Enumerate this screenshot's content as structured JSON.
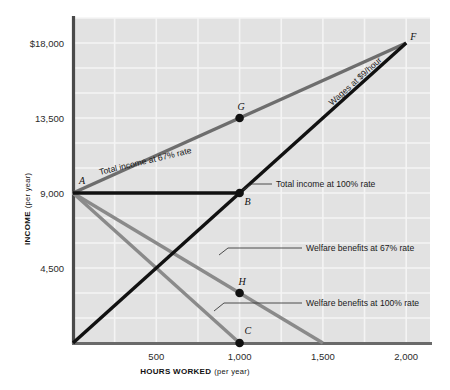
{
  "chart_data": {
    "type": "line",
    "title": "",
    "xlabel": "HOURS WORKED",
    "xlabel_sub": "(per year)",
    "ylabel": "INCOME",
    "ylabel_sub": "(per year)",
    "xlim": [
      0,
      2143
    ],
    "ylim": [
      0,
      19500
    ],
    "grid": true,
    "legend": "inline-annotations",
    "xticks": [
      {
        "value": 500,
        "label": "500"
      },
      {
        "value": 1000,
        "label": "1,000"
      },
      {
        "value": 1500,
        "label": "1,500"
      },
      {
        "value": 2000,
        "label": "2,000"
      }
    ],
    "yticks": [
      {
        "value": 4500,
        "label": "4,500"
      },
      {
        "value": 9000,
        "label": "9,000"
      },
      {
        "value": 13500,
        "label": "13,500"
      },
      {
        "value": 18000,
        "label": "$18,000"
      }
    ],
    "series": [
      {
        "name": "Wages at $9/hour",
        "label": "Wages at $9/hour",
        "color": "#111111",
        "width": 3.4,
        "points": [
          [
            0,
            0
          ],
          [
            2000,
            18000
          ]
        ]
      },
      {
        "name": "Total income at 67% rate",
        "label": "Total income at 67% rate",
        "color": "#6d6d6d",
        "width": 3.4,
        "points": [
          [
            0,
            9000
          ],
          [
            2000,
            18000
          ]
        ]
      },
      {
        "name": "Total income at 100% rate",
        "label": "Total income at 100% rate",
        "color": "#111111",
        "width": 3.4,
        "points": [
          [
            0,
            9000
          ],
          [
            1000,
            9000
          ]
        ]
      },
      {
        "name": "Welfare benefits at 67% rate",
        "label": "Welfare benefits at 67% rate",
        "color": "#8a8a8a",
        "width": 3.4,
        "points": [
          [
            0,
            9000
          ],
          [
            1500,
            0
          ]
        ]
      },
      {
        "name": "Welfare benefits at 100% rate",
        "label": "Welfare benefits at 100% rate",
        "color": "#8a8a8a",
        "width": 3.4,
        "points": [
          [
            0,
            9000
          ],
          [
            1000,
            0
          ]
        ]
      }
    ],
    "annotations": [
      {
        "id": "A",
        "label": "A",
        "x": 0,
        "y": 9000,
        "dot": false
      },
      {
        "id": "B",
        "label": "B",
        "x": 1000,
        "y": 9000,
        "dot": true
      },
      {
        "id": "C",
        "label": "C",
        "x": 1000,
        "y": 0,
        "dot": true
      },
      {
        "id": "F",
        "label": "F",
        "x": 2000,
        "y": 18000,
        "dot": false
      },
      {
        "id": "G",
        "label": "G",
        "x": 1000,
        "y": 13500,
        "dot": true
      },
      {
        "id": "H",
        "label": "H",
        "x": 1000,
        "y": 3000,
        "dot": true
      }
    ],
    "plot_bg": "#e2e2e2",
    "grid_color": "#f4f4f4",
    "axis_color": "#4a4a4a"
  }
}
